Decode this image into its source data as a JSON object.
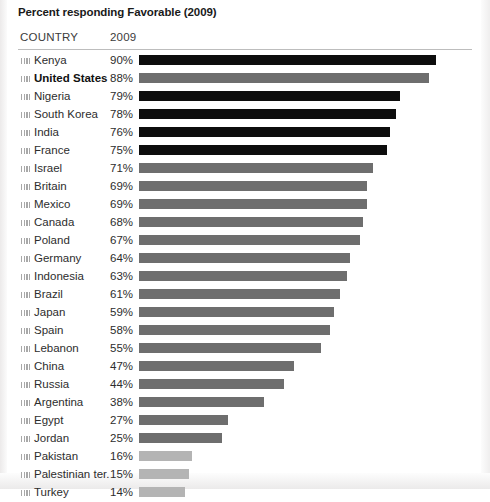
{
  "title": "Percent responding Favorable (2009)",
  "columns": {
    "country": "COUNTRY",
    "year": "2009"
  },
  "colors": {
    "bar_dark": "#0d0d0d",
    "bar_mid": "#6e6e6e",
    "bar_light": "#b4b4b4",
    "rule": "#bdbdbd",
    "text": "#2d2d2d",
    "background": "#ffffff"
  },
  "icons": {
    "row_marker": "flag-icon"
  },
  "chart_data": {
    "type": "bar",
    "orientation": "horizontal",
    "title": "Percent responding Favorable (2009)",
    "xlabel": "",
    "ylabel": "COUNTRY",
    "xlim": [
      0,
      100
    ],
    "grid": false,
    "legend": null,
    "series_name": "2009",
    "categories": [
      "Kenya",
      "United States",
      "Nigeria",
      "South Korea",
      "India",
      "France",
      "Israel",
      "Britain",
      "Mexico",
      "Canada",
      "Poland",
      "Germany",
      "Indonesia",
      "Brazil",
      "Japan",
      "Spain",
      "Lebanon",
      "China",
      "Russia",
      "Argentina",
      "Egypt",
      "Jordan",
      "Pakistan",
      "Palestinian ter.",
      "Turkey"
    ],
    "values": [
      90,
      88,
      79,
      78,
      76,
      75,
      71,
      69,
      69,
      68,
      67,
      64,
      63,
      61,
      59,
      58,
      55,
      47,
      44,
      38,
      27,
      25,
      16,
      15,
      14
    ],
    "labels": [
      "90%",
      "88%",
      "79%",
      "78%",
      "76%",
      "75%",
      "71%",
      "69%",
      "69%",
      "68%",
      "67%",
      "64%",
      "63%",
      "61%",
      "59%",
      "58%",
      "55%",
      "47%",
      "44%",
      "38%",
      "27%",
      "25%",
      "16%",
      "15%",
      "14%"
    ]
  },
  "rows": [
    {
      "country": "Kenya",
      "value": 90,
      "label": "90%",
      "tone": "tone-dark",
      "highlight": false
    },
    {
      "country": "United States",
      "value": 88,
      "label": "88%",
      "tone": "tone-mid",
      "highlight": true
    },
    {
      "country": "Nigeria",
      "value": 79,
      "label": "79%",
      "tone": "tone-dark",
      "highlight": false
    },
    {
      "country": "South Korea",
      "value": 78,
      "label": "78%",
      "tone": "tone-dark",
      "highlight": false
    },
    {
      "country": "India",
      "value": 76,
      "label": "76%",
      "tone": "tone-dark",
      "highlight": false
    },
    {
      "country": "France",
      "value": 75,
      "label": "75%",
      "tone": "tone-dark",
      "highlight": false
    },
    {
      "country": "Israel",
      "value": 71,
      "label": "71%",
      "tone": "tone-mid",
      "highlight": false
    },
    {
      "country": "Britain",
      "value": 69,
      "label": "69%",
      "tone": "tone-mid",
      "highlight": false
    },
    {
      "country": "Mexico",
      "value": 69,
      "label": "69%",
      "tone": "tone-mid",
      "highlight": false
    },
    {
      "country": "Canada",
      "value": 68,
      "label": "68%",
      "tone": "tone-mid",
      "highlight": false
    },
    {
      "country": "Poland",
      "value": 67,
      "label": "67%",
      "tone": "tone-mid",
      "highlight": false
    },
    {
      "country": "Germany",
      "value": 64,
      "label": "64%",
      "tone": "tone-mid",
      "highlight": false
    },
    {
      "country": "Indonesia",
      "value": 63,
      "label": "63%",
      "tone": "tone-mid",
      "highlight": false
    },
    {
      "country": "Brazil",
      "value": 61,
      "label": "61%",
      "tone": "tone-mid",
      "highlight": false
    },
    {
      "country": "Japan",
      "value": 59,
      "label": "59%",
      "tone": "tone-mid",
      "highlight": false
    },
    {
      "country": "Spain",
      "value": 58,
      "label": "58%",
      "tone": "tone-mid",
      "highlight": false
    },
    {
      "country": "Lebanon",
      "value": 55,
      "label": "55%",
      "tone": "tone-mid",
      "highlight": false
    },
    {
      "country": "China",
      "value": 47,
      "label": "47%",
      "tone": "tone-mid",
      "highlight": false
    },
    {
      "country": "Russia",
      "value": 44,
      "label": "44%",
      "tone": "tone-mid",
      "highlight": false
    },
    {
      "country": "Argentina",
      "value": 38,
      "label": "38%",
      "tone": "tone-mid",
      "highlight": false
    },
    {
      "country": "Egypt",
      "value": 27,
      "label": "27%",
      "tone": "tone-mid",
      "highlight": false
    },
    {
      "country": "Jordan",
      "value": 25,
      "label": "25%",
      "tone": "tone-mid",
      "highlight": false
    },
    {
      "country": "Pakistan",
      "value": 16,
      "label": "16%",
      "tone": "tone-light",
      "highlight": false
    },
    {
      "country": "Palestinian ter.",
      "value": 15,
      "label": "15%",
      "tone": "tone-light",
      "highlight": false
    },
    {
      "country": "Turkey",
      "value": 14,
      "label": "14%",
      "tone": "tone-light",
      "highlight": false
    }
  ]
}
